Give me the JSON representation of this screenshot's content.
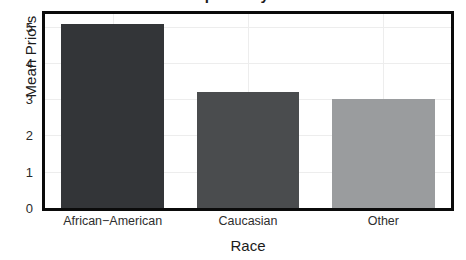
{
  "chart_data": {
    "type": "bar",
    "title": "Mean priors by race",
    "xlabel": "Race",
    "ylabel": "Mean Priors",
    "categories": [
      "African−American",
      "Caucasian",
      "Other"
    ],
    "values": [
      5.07,
      3.19,
      3.02
    ],
    "ylim": [
      0,
      5.35
    ],
    "yticks": [
      0,
      1,
      2,
      3,
      4,
      5
    ],
    "ytick_labels": [
      "0",
      "1",
      "2",
      "3",
      "4",
      "5"
    ],
    "grid": true,
    "grid_color": "#ededed",
    "legend": "none",
    "bar_colors": [
      "#333538",
      "#4a4c4e",
      "#9a9c9e"
    ],
    "panel_background": "#ffffff",
    "panel_border_color": "#0b0b0b",
    "bars": [
      {
        "label": "African−American",
        "value": 5.07,
        "color": "#333538"
      },
      {
        "label": "Caucasian",
        "value": 3.19,
        "color": "#4a4c4e"
      },
      {
        "label": "Other",
        "value": 3.02,
        "color": "#9a9c9e"
      }
    ]
  }
}
